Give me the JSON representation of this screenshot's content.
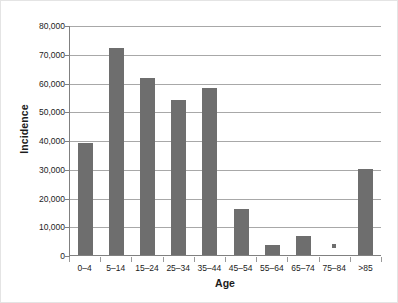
{
  "chart_data": {
    "type": "bar",
    "title": "",
    "subtitle": "",
    "xlabel": "Age",
    "ylabel": "Incidence",
    "categories": [
      "0–4",
      "5–14",
      "15–24",
      "25–34",
      "35–44",
      "45–54",
      "55–64",
      "65–74",
      "75–84",
      ">85"
    ],
    "values": [
      39000,
      72000,
      61500,
      54000,
      58000,
      16000,
      3500,
      6500,
      300,
      30000
    ],
    "ylim": [
      0,
      80000
    ],
    "ytick_values": [
      0,
      10000,
      20000,
      30000,
      40000,
      50000,
      60000,
      70000,
      80000
    ],
    "ytick_labels": [
      "0",
      "10,000",
      "20,000",
      "30,000",
      "40,000",
      "50,000",
      "60,000",
      "70,000",
      "80,000"
    ],
    "grid": true,
    "grid_axis": "y",
    "legend": false,
    "legend_position": "none",
    "bar_color": "#6e6e6e",
    "gridline_color": "#a8a8a8",
    "axis_color": "#808080",
    "background_color": "#ffffff"
  }
}
